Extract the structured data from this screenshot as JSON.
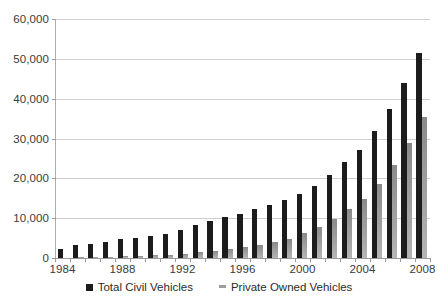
{
  "chart_data": {
    "type": "bar",
    "title": "",
    "subtitle": "",
    "xlabel": "",
    "ylabel": "",
    "grid": true,
    "legend_position": "bottom",
    "ylim": [
      0,
      60000
    ],
    "ytick_labels": [
      "0",
      "10,000",
      "20,000",
      "30,000",
      "40,000",
      "50,000",
      "60,000"
    ],
    "ytick_values": [
      0,
      10000,
      20000,
      30000,
      40000,
      50000,
      60000
    ],
    "categories": [
      "1984",
      "1985",
      "1986",
      "1987",
      "1988",
      "1989",
      "1990",
      "1991",
      "1992",
      "1993",
      "1994",
      "1995",
      "1996",
      "1997",
      "1998",
      "1999",
      "2000",
      "2001",
      "2002",
      "2003",
      "2004",
      "2005",
      "2006",
      "2007",
      "2008"
    ],
    "xtick_labels": [
      "1984",
      "1988",
      "1992",
      "1996",
      "2000",
      "2004",
      "2008"
    ],
    "xtick_categories": [
      "1984",
      "1988",
      "1992",
      "1996",
      "2000",
      "2004",
      "2008"
    ],
    "series": [
      {
        "name": "Total Civil Vehicles",
        "color": "#1c1c1c",
        "values": [
          2300,
          3200,
          3500,
          4000,
          4700,
          5100,
          5600,
          6100,
          7000,
          8200,
          9400,
          10400,
          11000,
          12200,
          13200,
          14500,
          16100,
          18000,
          20800,
          24000,
          27200,
          32000,
          37500,
          43900,
          51500
        ]
      },
      {
        "name": "Private Owned Vehicles",
        "color": "#9d9d9d",
        "values": [
          100,
          200,
          250,
          350,
          450,
          550,
          650,
          800,
          1100,
          1400,
          1800,
          2200,
          2700,
          3200,
          3900,
          4800,
          6200,
          7700,
          9700,
          12200,
          14800,
          18600,
          23300,
          28800,
          35500
        ]
      }
    ]
  },
  "legend": {
    "items": [
      {
        "label": "Total Civil Vehicles",
        "marker": "black-square-marker"
      },
      {
        "label": "Private Owned Vehicles",
        "marker": "gray-dash-marker"
      }
    ]
  }
}
